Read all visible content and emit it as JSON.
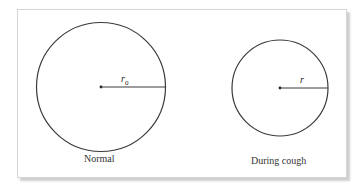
{
  "diagram": {
    "left": {
      "label": "Normal",
      "radius_label": "r",
      "radius_subscript": "0"
    },
    "right": {
      "label": "During cough",
      "radius_label": "r"
    },
    "colors": {
      "stroke": "#3a3a3a",
      "frame": "#d6d6d6"
    }
  }
}
